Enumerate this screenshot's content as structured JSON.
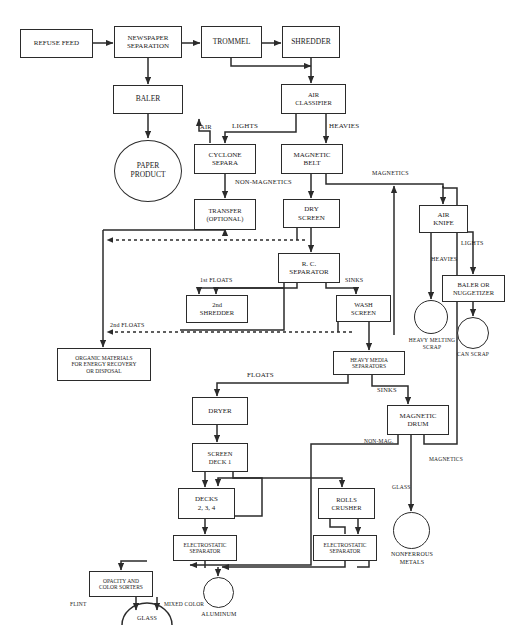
{
  "style": {
    "line_color": "#2b2b2b",
    "box_fill": "#ffffff",
    "text_color": "#1a1a1a",
    "background": "#ffffff"
  },
  "nodes": {
    "refuse_feed": {
      "label": "REFUSE FEED"
    },
    "newspaper_separation": {
      "line1": "NEWSPAPER",
      "line2": "SEPARATION"
    },
    "trommel": {
      "label": "TROMMEL"
    },
    "shredder": {
      "label": "SHREDDER"
    },
    "baler": {
      "label": "BALER"
    },
    "air_classifier": {
      "line1": "AIR",
      "line2": "CLASSIFIER"
    },
    "paper_product": {
      "line1": "PAPER",
      "line2": "PRODUCT"
    },
    "cyclone_separa": {
      "line1": "CYCLONE",
      "line2": "SEPARA"
    },
    "magnetic_belt": {
      "line1": "MAGNETIC",
      "line2": "BELT"
    },
    "transfer": {
      "line1": "TRANSFER",
      "line2": "(OPTIONAL)"
    },
    "dry_screen": {
      "line1": "DRY",
      "line2": "SCREEN"
    },
    "air_knife": {
      "line1": "AIR",
      "line2": "KNIFE"
    },
    "rc_separator": {
      "line1": "R. C.",
      "line2": "SEPARATOR"
    },
    "second_shredder": {
      "line1": "2nd",
      "line2": "SHREDDER"
    },
    "wash_screen": {
      "line1": "WASH",
      "line2": "SCREEN"
    },
    "baler_or_nuggetizer": {
      "line1": "BALER OR",
      "line2": "NUGGETIZER"
    },
    "heavy_melting_scrap": {
      "line1": "HEAVY  MELTING",
      "line2": "SCRAP"
    },
    "can_scrap": {
      "line1": "CAN",
      "line2": "SCRAP"
    },
    "organic_materials": {
      "line1": "ORGANIC MATERIALS",
      "line2": "FOR ENERGY RECOVERY",
      "line3": "OR DISPOSAL"
    },
    "heavy_media_separators": {
      "line1": "HEAVY MEDIA",
      "line2": "SEPARATORS"
    },
    "dryer": {
      "label": "DRYER"
    },
    "magnetic_drum": {
      "line1": "MAGNETIC",
      "line2": "DRUM"
    },
    "screen_deck_1": {
      "line1": "SCREEN",
      "line2": "DECK  1"
    },
    "decks_234": {
      "line1": "DECKS",
      "line2": "2, 3, 4"
    },
    "rolls_crusher": {
      "line1": "ROLLS",
      "line2": "CRUSHER"
    },
    "electrostatic_separator_1": {
      "line1": "ELECTROSTATIC",
      "line2": "SEPARATOR"
    },
    "electrostatic_separator_2": {
      "line1": "ELECTROSTATIC",
      "line2": "SEPARATOR"
    },
    "nonferrous_metals": {
      "line1": "NONFERROUS",
      "line2": "METALS"
    },
    "opacity_color_sorters": {
      "line1": "OPACITY  AND",
      "line2": "COLOR  SORTERS"
    },
    "aluminum": {
      "label": "ALUMINUM"
    },
    "glass": {
      "label": "GLASS"
    }
  },
  "edge_labels": {
    "air": "AIR",
    "lights_top": "LIGHTS",
    "heavies_top": "HEAVIES",
    "non_magnetics": "NON-MAGNETICS",
    "magnetics_top": "MAGNETICS",
    "lights_knife": "LIGHTS",
    "heavies_knife": "HEAVIES",
    "first_floats": "1st FLOATS",
    "sinks_rc": "SINKS",
    "second_floats": "2nd FLOATS",
    "floats": "FLOATS",
    "sinks_hms": "SINKS",
    "non_mag": "NON-MAG.",
    "magnetics_drum": "MAGNETICS",
    "glass_line": "GLASS",
    "flint": "FLINT",
    "mixed_color": "MIXED COLOR"
  }
}
